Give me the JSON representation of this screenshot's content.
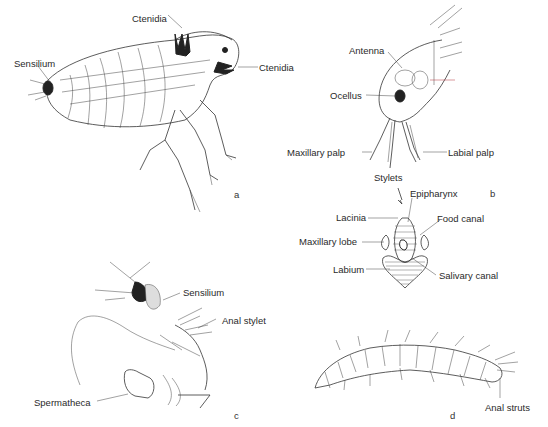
{
  "figure": {
    "panels": [
      {
        "id": "a",
        "letter": "a",
        "subject": "adult flea, lateral view",
        "labels": [
          "Ctenidia",
          "Sensilium",
          "Ctenidia"
        ]
      },
      {
        "id": "b",
        "letter": "b",
        "subject": "flea head and mouthparts with cross-section",
        "labels": [
          "Antenna",
          "Ocellus",
          "Maxillary palp",
          "Labial palp",
          "Stylets",
          "Epipharynx",
          "Lacinia",
          "Food canal",
          "Maxillary lobe",
          "Labium",
          "Salivary canal"
        ]
      },
      {
        "id": "c",
        "letter": "c",
        "subject": "female terminal segments",
        "labels": [
          "Sensilium",
          "Anal stylet",
          "Spermatheca"
        ]
      },
      {
        "id": "d",
        "letter": "d",
        "subject": "larva",
        "labels": [
          "Anal struts"
        ]
      }
    ]
  },
  "a": {
    "letter": "a",
    "ctenidia_top": "Ctenidia",
    "sensilium": "Sensilium",
    "ctenidia_right": "Ctenidia"
  },
  "b": {
    "letter": "b",
    "antenna": "Antenna",
    "ocellus": "Ocellus",
    "maxillary_palp": "Maxillary palp",
    "labial_palp": "Labial palp",
    "stylets": "Stylets",
    "epipharynx": "Epipharynx",
    "lacinia": "Lacinia",
    "food_canal": "Food canal",
    "maxillary_lobe": "Maxillary lobe",
    "labium": "Labium",
    "salivary_canal": "Salivary canal"
  },
  "c": {
    "letter": "c",
    "sensilium": "Sensilium",
    "anal_stylet": "Anal  stylet",
    "spermatheca": "Spermatheca"
  },
  "d": {
    "letter": "d",
    "anal_struts": "Anal struts"
  }
}
